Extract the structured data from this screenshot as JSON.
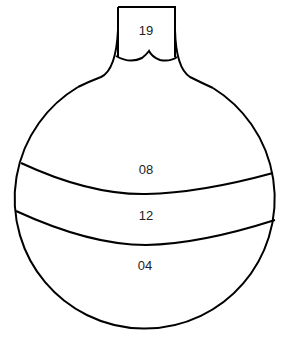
{
  "diagram": {
    "shape": "round-bottom flask",
    "stroke_color": "#000000",
    "background": "#ffffff",
    "labels": {
      "neck": "19",
      "top_band": "08",
      "middle_band": "12",
      "bottom_band": "04"
    }
  }
}
